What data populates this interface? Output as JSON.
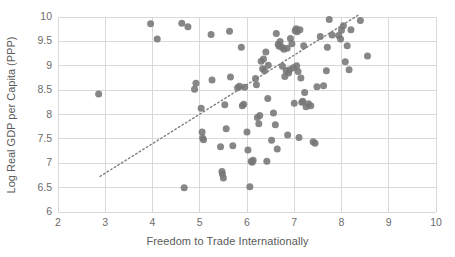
{
  "chart_data": {
    "type": "scatter",
    "title": "",
    "xlabel": "Freedom to Trade Internationally",
    "ylabel": "Log Real GDP per Capita (PPP)",
    "xlim": [
      2,
      10
    ],
    "ylim": [
      6,
      10
    ],
    "xticks": [
      2,
      3,
      4,
      5,
      6,
      7,
      8,
      9,
      10
    ],
    "yticks": [
      6,
      6.5,
      7,
      7.5,
      8,
      8.5,
      9,
      9.5,
      10
    ],
    "grid": "horizontal-and-vertical",
    "legend": "none",
    "marker_color": "#767676",
    "marker_size_px": 7,
    "gridline_color": "#d9d9d9",
    "trendline": {
      "style": "dotted",
      "color": "#808080",
      "x_start": 2.89,
      "y_start": 6.73,
      "x_end": 8.39,
      "y_end": 10.06
    },
    "points": [
      [
        2.86,
        8.42
      ],
      [
        3.96,
        9.86
      ],
      [
        4.1,
        9.55
      ],
      [
        4.62,
        9.87
      ],
      [
        4.67,
        6.5
      ],
      [
        4.75,
        9.8
      ],
      [
        4.89,
        8.52
      ],
      [
        4.92,
        8.64
      ],
      [
        5.03,
        8.13
      ],
      [
        5.05,
        7.64
      ],
      [
        5.06,
        7.52
      ],
      [
        5.08,
        7.48
      ],
      [
        5.24,
        9.64
      ],
      [
        5.26,
        8.71
      ],
      [
        5.44,
        7.34
      ],
      [
        5.47,
        6.83
      ],
      [
        5.48,
        6.78
      ],
      [
        5.5,
        6.7
      ],
      [
        5.53,
        8.2
      ],
      [
        5.56,
        7.71
      ],
      [
        5.63,
        9.71
      ],
      [
        5.65,
        8.77
      ],
      [
        5.7,
        7.36
      ],
      [
        5.8,
        8.55
      ],
      [
        5.84,
        8.58
      ],
      [
        5.88,
        9.38
      ],
      [
        5.9,
        8.18
      ],
      [
        5.93,
        8.21
      ],
      [
        6.0,
        7.64
      ],
      [
        6.02,
        7.27
      ],
      [
        6.06,
        6.52
      ],
      [
        6.09,
        7.04
      ],
      [
        6.11,
        7.02
      ],
      [
        6.13,
        7.06
      ],
      [
        6.18,
        8.74
      ],
      [
        6.22,
        7.94
      ],
      [
        6.25,
        7.81
      ],
      [
        6.27,
        7.98
      ],
      [
        6.3,
        9.09
      ],
      [
        6.33,
        8.94
      ],
      [
        6.35,
        9.14
      ],
      [
        6.37,
        8.9
      ],
      [
        6.4,
        9.28
      ],
      [
        6.42,
        7.04
      ],
      [
        6.44,
        8.33
      ],
      [
        6.52,
        7.47
      ],
      [
        6.56,
        8.03
      ],
      [
        6.6,
        7.79
      ],
      [
        6.62,
        9.66
      ],
      [
        6.64,
        7.29
      ],
      [
        6.66,
        9.44
      ],
      [
        6.7,
        9.5
      ],
      [
        6.74,
        9.38
      ],
      [
        6.78,
        9.34
      ],
      [
        6.8,
        8.78
      ],
      [
        6.83,
        8.9
      ],
      [
        6.86,
        7.58
      ],
      [
        6.88,
        8.85
      ],
      [
        6.9,
        8.92
      ],
      [
        6.92,
        9.56
      ],
      [
        6.95,
        9.45
      ],
      [
        6.98,
        8.96
      ],
      [
        7.0,
        8.23
      ],
      [
        7.02,
        9.72
      ],
      [
        7.04,
        9.76
      ],
      [
        7.06,
        9.7
      ],
      [
        7.08,
        8.88
      ],
      [
        7.1,
        7.53
      ],
      [
        7.12,
        9.74
      ],
      [
        7.14,
        8.75
      ],
      [
        7.16,
        8.25
      ],
      [
        7.18,
        8.27
      ],
      [
        7.2,
        9.41
      ],
      [
        7.22,
        8.45
      ],
      [
        7.25,
        8.16
      ],
      [
        7.4,
        7.44
      ],
      [
        7.44,
        7.41
      ],
      [
        7.48,
        8.57
      ],
      [
        7.55,
        9.6
      ],
      [
        7.62,
        8.59
      ],
      [
        7.68,
        8.9
      ],
      [
        7.7,
        9.38
      ],
      [
        7.74,
        9.95
      ],
      [
        7.8,
        9.63
      ],
      [
        7.94,
        9.62
      ],
      [
        7.98,
        9.55
      ],
      [
        8.0,
        9.73
      ],
      [
        8.04,
        9.82
      ],
      [
        8.08,
        9.08
      ],
      [
        8.12,
        9.41
      ],
      [
        8.16,
        8.92
      ],
      [
        8.2,
        9.74
      ],
      [
        8.4,
        9.93
      ],
      [
        8.55,
        9.2
      ],
      [
        6.45,
        9.01
      ],
      [
        6.85,
        9.36
      ],
      [
        7.3,
        8.22
      ],
      [
        6.2,
        8.61
      ],
      [
        5.95,
        8.56
      ],
      [
        7.05,
        9.0
      ],
      [
        6.75,
        8.99
      ],
      [
        6.68,
        9.4
      ],
      [
        7.35,
        8.18
      ]
    ]
  }
}
